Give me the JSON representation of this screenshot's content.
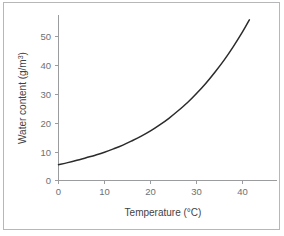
{
  "figure": {
    "background_color": "#ffffff",
    "border_color": "#b5b7b9",
    "axis_color": "#9a9c9e",
    "tick_label_color": "#6d7073",
    "curve_color": "#2b2b2b"
  },
  "chart_data": {
    "type": "line",
    "title": "",
    "subtitle": "",
    "xlabel": "Temperature (°C)",
    "xlabel_base": "Temperature (",
    "xlabel_unit": "°C)",
    "ylabel": "Water content (g/m3)",
    "ylabel_base": "Water content (g/m",
    "ylabel_sup": "3",
    "ylabel_close": ")",
    "xlim": [
      0,
      48
    ],
    "ylim": [
      0,
      58
    ],
    "xticks": [
      0,
      10,
      20,
      30,
      40
    ],
    "yticks": [
      0,
      10,
      20,
      30,
      40,
      50
    ],
    "xtick_labels": [
      "0",
      "10",
      "20",
      "30",
      "40"
    ],
    "ytick_labels": [
      "0",
      "10",
      "20",
      "30",
      "40",
      "50"
    ],
    "grid": false,
    "legend": null,
    "legend_position": "none",
    "annotations": [],
    "series": [
      {
        "name": "Saturation water content",
        "x": [
          0,
          2,
          4,
          6,
          8,
          10,
          12,
          14,
          16,
          18,
          20,
          22,
          24,
          26,
          28,
          30,
          32,
          34,
          36,
          38,
          40,
          41.5
        ],
        "values": [
          5.5,
          6.2,
          7.0,
          7.9,
          8.8,
          9.8,
          11.0,
          12.3,
          13.8,
          15.4,
          17.2,
          19.3,
          21.6,
          24.2,
          27.0,
          30.2,
          33.7,
          37.6,
          41.8,
          46.5,
          51.6,
          55.8
        ]
      }
    ]
  }
}
